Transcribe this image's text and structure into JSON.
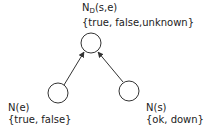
{
  "diagram": {
    "type": "bayesian-network",
    "nodes": [
      {
        "id": "nd",
        "name_main": "N",
        "name_sub": "D",
        "name_args": "(s,e)",
        "states": "{true, false,unknown}",
        "cx": 91,
        "cy": 43,
        "r": 10
      },
      {
        "id": "ne",
        "name": "N(e)",
        "states": "{true, false}",
        "cx": 58,
        "cy": 93,
        "r": 10
      },
      {
        "id": "ns",
        "name": "N(s)",
        "states": "{ok, down}",
        "cx": 129,
        "cy": 91,
        "r": 10
      }
    ],
    "edges": [
      {
        "from": "ne",
        "to": "nd"
      },
      {
        "from": "ns",
        "to": "nd"
      }
    ],
    "colors": {
      "stroke": "#333333",
      "text": "#222222",
      "background": "#ffffff"
    }
  }
}
